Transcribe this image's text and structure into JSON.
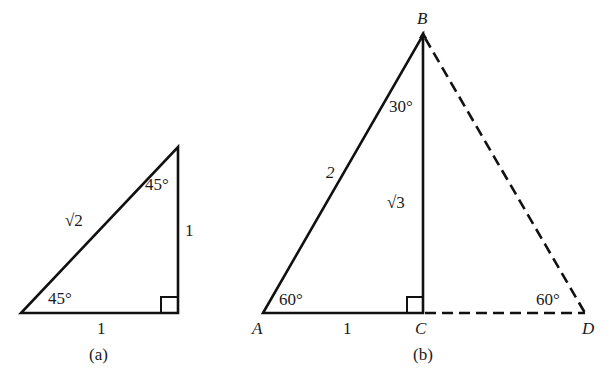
{
  "figure_a": {
    "caption": "(a)",
    "hypotenuse": "√2",
    "leg_vertical": "1",
    "leg_horizontal": "1",
    "angle_bottom": "45°",
    "angle_top": "45°"
  },
  "figure_b": {
    "caption": "(b)",
    "vertices": {
      "A": "A",
      "B": "B",
      "C": "C",
      "D": "D"
    },
    "side_AB": "2",
    "side_BC": "√3",
    "side_AC": "1",
    "angle_A": "60°",
    "angle_B": "30°",
    "angle_D": "60°"
  },
  "colors": {
    "stroke": "#111111",
    "background": "#ffffff"
  }
}
